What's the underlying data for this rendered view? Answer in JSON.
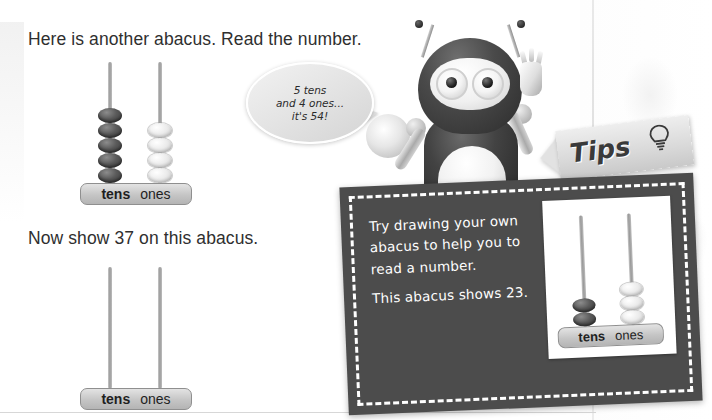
{
  "worksheet": {
    "instruction_1": "Here is another abacus. Read the number.",
    "instruction_2": "Now show 37 on this abacus."
  },
  "speech_bubble": {
    "line_1": "5 tens",
    "line_2": "and 4 ones...",
    "line_3": "it's 54!"
  },
  "tips": {
    "banner_label": "Tips",
    "line_1": "Try drawing your own",
    "line_2": "abacus to help you to",
    "line_3": "read a number.",
    "line_4": "This abacus shows 23."
  },
  "abacus_labels": {
    "tens": "tens",
    "ones": "ones"
  },
  "abacuses": [
    {
      "id": "abacus-54",
      "name": "worked-example-abacus",
      "value": 54,
      "tens_beads": 5,
      "ones_beads": 4,
      "tens_bead_color": "#4a4a4a",
      "ones_bead_color": "#ebebeb"
    },
    {
      "id": "abacus-empty",
      "name": "student-answer-abacus",
      "value": null,
      "tens_beads": 0,
      "ones_beads": 0
    },
    {
      "id": "abacus-23",
      "name": "tips-example-abacus",
      "value": 23,
      "tens_beads": 2,
      "ones_beads": 3,
      "tens_bead_color": "#4a4a4a",
      "ones_bead_color": "#ebebeb"
    }
  ],
  "colors": {
    "text": "#2f2f2f",
    "tips_box_bg": "#4c4c4c",
    "tips_box_border": "#ffffff",
    "abacus_base": "#c5c5c5",
    "rod": "#9a9a9a"
  }
}
